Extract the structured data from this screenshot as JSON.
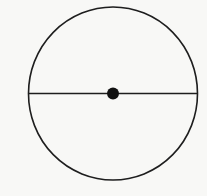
{
  "diagram": {
    "type": "circle-with-diameter",
    "background": "#f8f8f6",
    "stroke_color": "#1e1e1e",
    "circle": {
      "cx": 113,
      "cy": 93.5,
      "rx": 84.5,
      "ry": 86.5,
      "stroke_width": 1.6
    },
    "diameter": {
      "x1": 28.5,
      "y1": 93.5,
      "x2": 197.5,
      "y2": 93.5,
      "stroke_width": 1.6
    },
    "center_point": {
      "cx": 113,
      "cy": 93.5,
      "r": 6,
      "fill": "#111111"
    }
  }
}
